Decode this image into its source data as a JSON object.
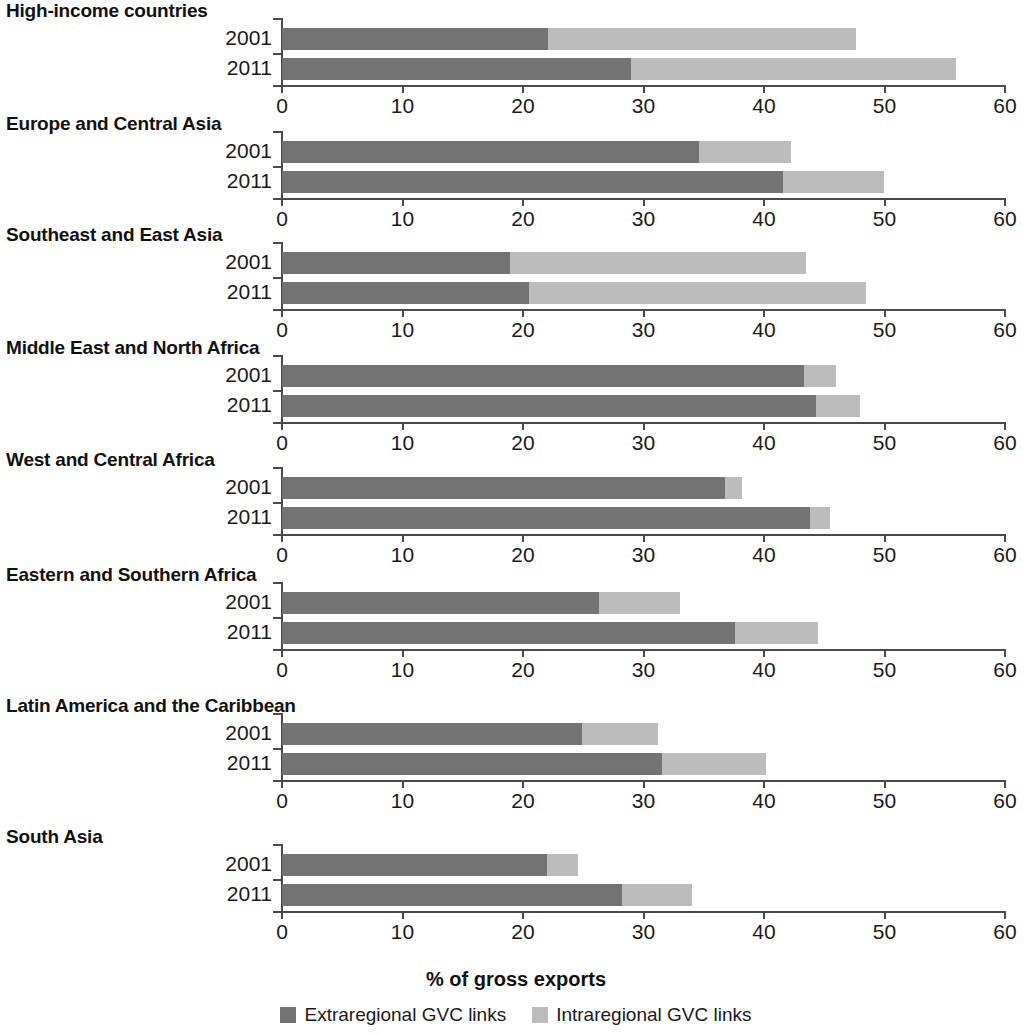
{
  "chart_data": {
    "type": "bar",
    "title": "",
    "subtitle": "",
    "orientation": "horizontal",
    "stacked": true,
    "xlabel": "% of gross exports",
    "ylabel": "",
    "xlim": [
      0,
      60
    ],
    "xticks": [
      0,
      10,
      20,
      30,
      40,
      50,
      60
    ],
    "xtick_labels": [
      "0",
      "10",
      "20",
      "30",
      "40",
      "50",
      "60"
    ],
    "grid": false,
    "legend_position": "bottom",
    "categories": [
      "2001",
      "2011"
    ],
    "legend": [
      "Extraregional GVC links",
      "Intraregional GVC links"
    ],
    "series": [
      {
        "name": "Extraregional GVC links",
        "color": "#737373"
      },
      {
        "name": "Intraregional GVC links",
        "color": "#bcbcbc"
      }
    ],
    "panels": [
      {
        "title": "High-income countries",
        "rows": [
          {
            "year": "2001",
            "extraregional": 22.1,
            "intraregional": 25.5,
            "total": 47.6
          },
          {
            "year": "2011",
            "extraregional": 29.0,
            "intraregional": 26.9,
            "total": 55.9
          }
        ]
      },
      {
        "title": "Europe and Central Asia",
        "rows": [
          {
            "year": "2001",
            "extraregional": 34.6,
            "intraregional": 7.6,
            "total": 42.2
          },
          {
            "year": "2011",
            "extraregional": 41.6,
            "intraregional": 8.4,
            "total": 50.0
          }
        ]
      },
      {
        "title": "Southeast and East Asia",
        "rows": [
          {
            "year": "2001",
            "extraregional": 18.9,
            "intraregional": 24.6,
            "total": 43.5
          },
          {
            "year": "2011",
            "extraregional": 20.5,
            "intraregional": 28.0,
            "total": 48.5
          }
        ]
      },
      {
        "title": "Middle East and North Africa",
        "rows": [
          {
            "year": "2001",
            "extraregional": 43.3,
            "intraregional": 2.7,
            "total": 46.0
          },
          {
            "year": "2011",
            "extraregional": 44.3,
            "intraregional": 3.7,
            "total": 48.0
          }
        ]
      },
      {
        "title": "West and Central Africa",
        "rows": [
          {
            "year": "2001",
            "extraregional": 36.8,
            "intraregional": 1.4,
            "total": 38.2
          },
          {
            "year": "2011",
            "extraregional": 43.8,
            "intraregional": 1.7,
            "total": 45.5
          }
        ]
      },
      {
        "title": "Eastern and Southern Africa",
        "rows": [
          {
            "year": "2001",
            "extraregional": 26.3,
            "intraregional": 6.7,
            "total": 33.0
          },
          {
            "year": "2011",
            "extraregional": 37.6,
            "intraregional": 6.9,
            "total": 44.5
          }
        ]
      },
      {
        "title": "Latin America and the Caribbean",
        "rows": [
          {
            "year": "2001",
            "extraregional": 24.9,
            "intraregional": 6.3,
            "total": 31.2
          },
          {
            "year": "2011",
            "extraregional": 31.5,
            "intraregional": 8.7,
            "total": 40.2
          }
        ]
      },
      {
        "title": "South Asia",
        "rows": [
          {
            "year": "2001",
            "extraregional": 22.0,
            "intraregional": 2.6,
            "total": 24.6
          },
          {
            "year": "2011",
            "extraregional": 28.2,
            "intraregional": 5.8,
            "total": 34.0
          }
        ]
      }
    ]
  },
  "colors": {
    "extraregional": "#737373",
    "intraregional": "#bcbcbc",
    "axis": "#4a4a4a",
    "text": "#1a1a1a",
    "background": "#ffffff"
  },
  "footer": {
    "axis_caption": "% of gross exports",
    "legend": [
      {
        "label": "Extraregional GVC links",
        "color": "#737373"
      },
      {
        "label": "Intraregional GVC links",
        "color": "#bcbcbc"
      }
    ]
  }
}
